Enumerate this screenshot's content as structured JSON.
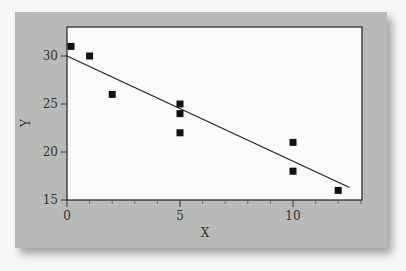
{
  "chart_data": {
    "type": "scatter",
    "title": "",
    "xlabel": "X",
    "ylabel": "Y",
    "xlim": [
      0,
      13
    ],
    "ylim": [
      15,
      33
    ],
    "xticks": [
      0,
      5,
      10
    ],
    "yticks": [
      15,
      20,
      25,
      30
    ],
    "grid": false,
    "legend": null,
    "points": [
      {
        "x": 0,
        "y": 31
      },
      {
        "x": 1,
        "y": 30
      },
      {
        "x": 2,
        "y": 26
      },
      {
        "x": 5,
        "y": 25
      },
      {
        "x": 5,
        "y": 24
      },
      {
        "x": 5,
        "y": 22
      },
      {
        "x": 10,
        "y": 21
      },
      {
        "x": 10,
        "y": 18
      },
      {
        "x": 12,
        "y": 16
      }
    ],
    "regression_line": {
      "x0": 0,
      "y0": 30,
      "x1": 12.5,
      "y1": 16.3
    },
    "colors": {
      "panel": "#b9b9b7",
      "plot_bg": "#fbfbfa",
      "marker": "#111111",
      "line": "#222222"
    }
  }
}
